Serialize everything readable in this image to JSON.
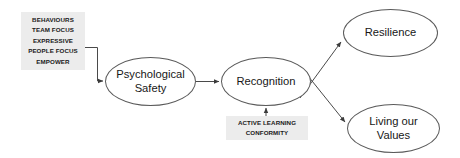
{
  "diagram": {
    "type": "flow-diagram",
    "background_color": "#ffffff",
    "node_stroke_color": "#5a5a5a",
    "label_box_color": "#ececec",
    "edge_color": "#4a4a4a",
    "text_color": "#171717",
    "inputs": {
      "behaviours": {
        "lines": [
          "BEHAVIOURS",
          "TEAM FOCUS",
          "EXPRESSIVE",
          "PEOPLE FOCUS",
          "EMPOWER"
        ]
      },
      "active_learning": {
        "lines": [
          "ACTIVE LEARNING",
          "CONFORMITY"
        ]
      }
    },
    "nodes": {
      "psychological_safety": {
        "line1": "Psychological",
        "line2": "Safety"
      },
      "recognition": {
        "line1": "Recognition"
      },
      "resilience": {
        "line1": "Resilience"
      },
      "living_our_values": {
        "line1": "Living our",
        "line2": "Values"
      }
    },
    "edges": [
      {
        "from": "behaviours",
        "to": "psychological_safety",
        "style": "elbow-arrow"
      },
      {
        "from": "psychological_safety",
        "to": "recognition",
        "style": "straight-arrow"
      },
      {
        "from": "active_learning",
        "to": "recognition",
        "style": "vertical-arrow"
      },
      {
        "from": "recognition",
        "to": "resilience",
        "style": "diagonal-arrow"
      },
      {
        "from": "recognition",
        "to": "living_our_values",
        "style": "diagonal-arrow"
      }
    ]
  }
}
